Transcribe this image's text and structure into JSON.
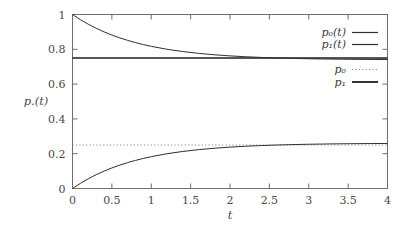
{
  "chart_data": {
    "type": "line",
    "title": "",
    "xlabel": "t",
    "ylabel": "p.(t)",
    "xlim": [
      0,
      4
    ],
    "ylim": [
      0,
      1
    ],
    "grid": false,
    "legend_position": "top-right",
    "xticks": [
      "0",
      "0.5",
      "1",
      "1.5",
      "2",
      "2.5",
      "3",
      "3.5",
      "4"
    ],
    "xtick_values": [
      0,
      0.5,
      1,
      1.5,
      2,
      2.5,
      3,
      3.5,
      4
    ],
    "yticks": [
      "0",
      "0.2",
      "0.4",
      "0.6",
      "0.8",
      "1"
    ],
    "ytick_values": [
      0,
      0.2,
      0.4,
      0.6,
      0.8,
      1
    ],
    "series": [
      {
        "name": "p_0(t)",
        "legend_label": "p₀(t)",
        "style": "solid",
        "description": "exponential decay from 1 to asymptote 0.75",
        "x": [
          0,
          0.1,
          0.2,
          0.3,
          0.4,
          0.5,
          0.6,
          0.7,
          0.8,
          0.9,
          1,
          1.2,
          1.4,
          1.6,
          1.8,
          2,
          2.2,
          2.4,
          2.6,
          2.8,
          3,
          3.2,
          3.4,
          3.6,
          3.8,
          4
        ],
        "values": [
          1.0,
          0.9704,
          0.9442,
          0.9208,
          0.9002,
          0.8819,
          0.8656,
          0.8512,
          0.8384,
          0.8271,
          0.817,
          0.8002,
          0.7871,
          0.7766,
          0.7686,
          0.7622,
          0.7571,
          0.7532,
          0.75,
          0.7476,
          0.7457,
          0.7443,
          0.7431,
          0.7423,
          0.7416,
          0.7411
        ]
      },
      {
        "name": "p_1(t)",
        "legend_label": "p₁(t)",
        "style": "solid",
        "description": "exponential rise from 0 to asymptote 0.25",
        "x": [
          0,
          0.1,
          0.2,
          0.3,
          0.4,
          0.5,
          0.6,
          0.7,
          0.8,
          0.9,
          1,
          1.2,
          1.4,
          1.6,
          1.8,
          2,
          2.2,
          2.4,
          2.6,
          2.8,
          3,
          3.2,
          3.4,
          3.6,
          3.8,
          4
        ],
        "values": [
          0.0,
          0.0296,
          0.0558,
          0.0792,
          0.0998,
          0.1181,
          0.1344,
          0.1488,
          0.1616,
          0.1729,
          0.183,
          0.1998,
          0.2129,
          0.2234,
          0.2314,
          0.2378,
          0.2429,
          0.2468,
          0.25,
          0.2524,
          0.2543,
          0.2557,
          0.2569,
          0.2577,
          0.2584,
          0.2589
        ]
      },
      {
        "name": "p_0",
        "legend_label": "p₀",
        "style": "dotted",
        "description": "stationary asymptote value",
        "constant_value": 0.25
      },
      {
        "name": "p_1",
        "legend_label": "p₁",
        "style": "solid-thick",
        "description": "stationary asymptote value",
        "constant_value": 0.75
      }
    ],
    "annotations": []
  },
  "legend": {
    "group_a": [
      {
        "label": "p₀(t)",
        "sample": "solid"
      },
      {
        "label": "p₁(t)",
        "sample": "solid"
      }
    ],
    "group_b": [
      {
        "label": "p₀",
        "sample": "dotted"
      },
      {
        "label": "p₁",
        "sample": "solid-thick"
      }
    ]
  },
  "axes": {
    "x_title": "t",
    "y_title": "p.(t)"
  },
  "colors": {
    "frame": "#6e6e6e",
    "curve": "#303030",
    "asymptote_solid": "#1e1e1e",
    "asymptote_dotted": "#8a8a8a",
    "background": "#ffffff",
    "text": "#4a4a4a"
  }
}
